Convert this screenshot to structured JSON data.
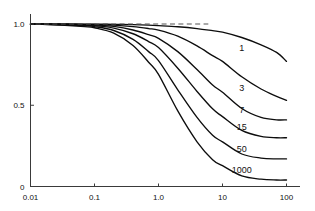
{
  "chart_data": {
    "type": "line",
    "title": "",
    "subtitle": "",
    "xlabel": "",
    "ylabel": "",
    "xscale": "log",
    "yscale": "linear",
    "xlim": [
      0.01,
      100
    ],
    "ylim": [
      0,
      1.0
    ],
    "grid": false,
    "legend_position": "inline-right-of-curve",
    "x_tick_labels": [
      "0.01",
      "0.1",
      "1.0",
      "10",
      "100"
    ],
    "x_tick_values": [
      0.01,
      0.1,
      1.0,
      10,
      100
    ],
    "y_tick_labels": [
      "0",
      "0.5",
      "1.0"
    ],
    "y_tick_values": [
      0,
      0.5,
      1.0
    ],
    "annotations": [
      {
        "name": "unit-asymptote",
        "kind": "dashed-horizontal-line",
        "y": 1.0,
        "x_start": 0.012,
        "x_end": 6.0,
        "style": "dashed"
      }
    ],
    "x": [
      0.01,
      0.02,
      0.04,
      0.07,
      0.1,
      0.2,
      0.4,
      0.7,
      1.0,
      2.0,
      4.0,
      7.0,
      10,
      20,
      40,
      70,
      100
    ],
    "series": [
      {
        "name": "1",
        "label": "1",
        "label_x": 20.0,
        "label_y": 0.835,
        "values": [
          1.0,
          1.0,
          1.0,
          0.999,
          0.999,
          0.998,
          0.996,
          0.993,
          0.99,
          0.983,
          0.972,
          0.959,
          0.95,
          0.917,
          0.872,
          0.825,
          0.77
        ]
      },
      {
        "name": "3",
        "label": "3",
        "label_x": 20.0,
        "label_y": 0.585,
        "values": [
          1.0,
          0.999,
          0.999,
          0.998,
          0.997,
          0.993,
          0.984,
          0.972,
          0.962,
          0.925,
          0.865,
          0.805,
          0.77,
          0.675,
          0.6,
          0.555,
          0.53
        ]
      },
      {
        "name": "7",
        "label": "7",
        "label_x": 20.0,
        "label_y": 0.455,
        "values": [
          1.0,
          0.999,
          0.998,
          0.996,
          0.994,
          0.985,
          0.963,
          0.934,
          0.912,
          0.83,
          0.72,
          0.625,
          0.58,
          0.48,
          0.425,
          0.41,
          0.41
        ]
      },
      {
        "name": "15",
        "label": "15",
        "label_x": 20.0,
        "label_y": 0.345,
        "values": [
          0.999,
          0.998,
          0.996,
          0.993,
          0.99,
          0.975,
          0.94,
          0.892,
          0.855,
          0.728,
          0.585,
          0.478,
          0.43,
          0.345,
          0.308,
          0.3,
          0.3
        ]
      },
      {
        "name": "50",
        "label": "50",
        "label_x": 20.0,
        "label_y": 0.215,
        "values": [
          0.999,
          0.997,
          0.994,
          0.989,
          0.984,
          0.96,
          0.905,
          0.83,
          0.775,
          0.595,
          0.425,
          0.315,
          0.275,
          0.2,
          0.175,
          0.17,
          0.17
        ]
      },
      {
        "name": "1000",
        "label": "1000",
        "label_x": 20.0,
        "label_y": 0.085,
        "values": [
          0.999,
          0.996,
          0.991,
          0.984,
          0.977,
          0.944,
          0.868,
          0.765,
          0.69,
          0.465,
          0.275,
          0.165,
          0.128,
          0.065,
          0.045,
          0.04,
          0.04
        ]
      }
    ]
  },
  "colors": {
    "curve": "#0d0d0d",
    "axis": "#3a3a3a",
    "asymptote": "#555555",
    "text": "#111111",
    "background": "#ffffff"
  }
}
